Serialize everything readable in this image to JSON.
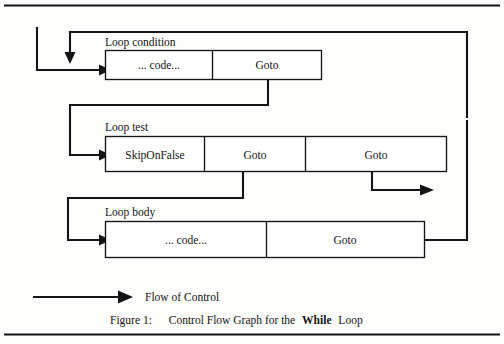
{
  "figure": {
    "title_label": "Figure 1:",
    "caption_prefix": "Control Flow Graph for the",
    "caption_emphasis": "While",
    "caption_suffix": "Loop",
    "legend": {
      "arrow_name": "flow-of-control-arrow",
      "label": "Flow of Control"
    },
    "colors": {
      "ink": "#141414",
      "paper": "#fdfdfc",
      "box_fill": "#ffffff"
    },
    "blocks": [
      {
        "id": "loop-condition",
        "label": "Loop condition",
        "cells": [
          {
            "id": "loop-condition-code",
            "label": "... code..."
          },
          {
            "id": "loop-condition-goto",
            "label": "Goto"
          }
        ]
      },
      {
        "id": "loop-test",
        "label": "Loop test",
        "cells": [
          {
            "id": "loop-test-skiponfalse",
            "label": "SkipOnFalse"
          },
          {
            "id": "loop-test-goto-1",
            "label": "Goto"
          },
          {
            "id": "loop-test-goto-2",
            "label": "Goto"
          }
        ]
      },
      {
        "id": "loop-body",
        "label": "Loop body",
        "cells": [
          {
            "id": "loop-body-code",
            "label": "... code..."
          },
          {
            "id": "loop-body-goto",
            "label": "Goto"
          }
        ]
      }
    ]
  }
}
